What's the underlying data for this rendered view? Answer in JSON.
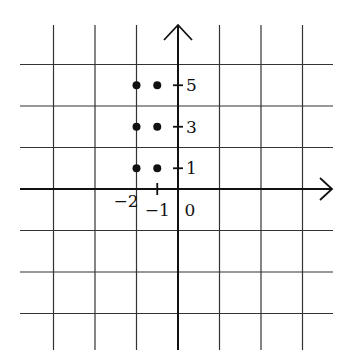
{
  "chart_data": {
    "type": "scatter",
    "title": "",
    "xlabel": "",
    "ylabel": "",
    "grid": true,
    "grid_step": 2,
    "xlim": [
      -8,
      8
    ],
    "ylim": [
      -8,
      8
    ],
    "x_tick_labels": [
      {
        "value": -2,
        "label": "−2"
      },
      {
        "value": -1,
        "label": "−1"
      },
      {
        "value": 0,
        "label": "0"
      }
    ],
    "y_tick_labels": [
      {
        "value": 1,
        "label": "1"
      },
      {
        "value": 3,
        "label": "3"
      },
      {
        "value": 5,
        "label": "5"
      }
    ],
    "points": [
      {
        "x": -2,
        "y": 1
      },
      {
        "x": -1,
        "y": 1
      },
      {
        "x": -2,
        "y": 3
      },
      {
        "x": -1,
        "y": 3
      },
      {
        "x": -2,
        "y": 5
      },
      {
        "x": -1,
        "y": 5
      }
    ],
    "colors": {
      "ink": "#111111",
      "grid": "#333333",
      "background": "#ffffff"
    }
  }
}
